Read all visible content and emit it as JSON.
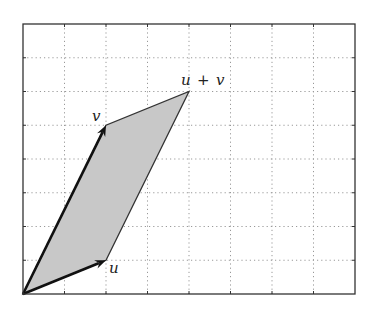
{
  "diagram": {
    "grid": {
      "cols": 8,
      "rows": 8,
      "style": "dotted",
      "color": "#999999"
    },
    "frame": {
      "x0": 23,
      "y0": 24,
      "x1": 355,
      "y1": 294
    },
    "vectors": [
      {
        "name": "u",
        "label": "u",
        "to": [
          2,
          1
        ]
      },
      {
        "name": "v",
        "label": "v",
        "to": [
          2,
          5
        ]
      }
    ],
    "sum": {
      "label_left": "u",
      "label_op": "+",
      "label_right": "v",
      "to": [
        4,
        6
      ]
    },
    "fill_color": "#c8c8c8",
    "edge_color": "#333333",
    "arrow_color": "#111111"
  }
}
